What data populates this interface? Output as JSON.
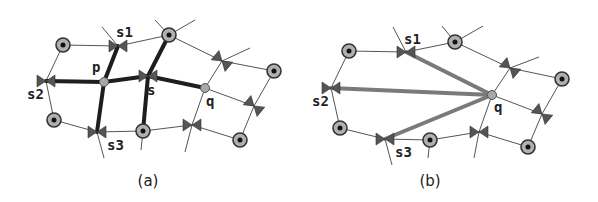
{
  "figure": {
    "colors": {
      "thin_edge": "#555555",
      "thick_edge_a": "#1e1e1e",
      "thick_edge_b": "#7a7a7a",
      "bowtie": "#555555",
      "node_ring": "#333333",
      "node_fill": "#b0b0b0",
      "node_center": "#111111",
      "point_fill": "#a8a8a8"
    },
    "panels": [
      {
        "id": "a",
        "caption": "(a)",
        "caption_pos": [
          148,
          186
        ],
        "circles": [
          [
            63,
            45
          ],
          [
            169,
            35
          ],
          [
            274,
            71
          ],
          [
            54,
            120
          ],
          [
            143,
            131
          ],
          [
            240,
            140
          ]
        ],
        "points": [
          {
            "name": "p",
            "pos": [
              104,
              82
            ],
            "label": "p",
            "label_pos": [
              92,
              72
            ]
          },
          {
            "name": "q",
            "pos": [
              205,
              88
            ],
            "label": "q",
            "label_pos": [
              206,
              106
            ]
          }
        ],
        "bowties": [
          {
            "name": "s1",
            "pos": [
              118,
              46
            ],
            "angle": 0,
            "label": "s1",
            "label_pos": [
              116,
              37
            ]
          },
          {
            "name": "s2",
            "pos": [
              46,
              81
            ],
            "angle": 0,
            "label": "s2",
            "label_pos": [
              27,
              99
            ]
          },
          {
            "name": "s",
            "pos": [
              148,
              76
            ],
            "angle": 0,
            "label": "s",
            "label_pos": [
              147,
              95
            ]
          },
          {
            "name": "s3",
            "pos": [
              97,
              132
            ],
            "angle": 0,
            "label": "s3",
            "label_pos": [
              107,
              150
            ]
          },
          {
            "name": "b1",
            "pos": [
              222,
              61
            ],
            "angle": 40,
            "label": "",
            "label_pos": [
              0,
              0
            ]
          },
          {
            "name": "b2",
            "pos": [
              254,
              106
            ],
            "angle": 40,
            "label": "",
            "label_pos": [
              0,
              0
            ]
          },
          {
            "name": "b3",
            "pos": [
              192,
              125
            ],
            "angle": 0,
            "label": "",
            "label_pos": [
              0,
              0
            ]
          }
        ],
        "thin_edges": [
          [
            [
              63,
              45
            ],
            [
              118,
              46
            ]
          ],
          [
            [
              118,
              46
            ],
            [
              169,
              35
            ]
          ],
          [
            [
              169,
              35
            ],
            [
              222,
              61
            ]
          ],
          [
            [
              222,
              61
            ],
            [
              274,
              71
            ]
          ],
          [
            [
              274,
              71
            ],
            [
              254,
              106
            ]
          ],
          [
            [
              254,
              106
            ],
            [
              240,
              140
            ]
          ],
          [
            [
              240,
              140
            ],
            [
              192,
              125
            ]
          ],
          [
            [
              192,
              125
            ],
            [
              143,
              131
            ]
          ],
          [
            [
              143,
              131
            ],
            [
              97,
              132
            ]
          ],
          [
            [
              97,
              132
            ],
            [
              54,
              120
            ]
          ],
          [
            [
              54,
              120
            ],
            [
              46,
              81
            ]
          ],
          [
            [
              46,
              81
            ],
            [
              63,
              45
            ]
          ],
          [
            [
              205,
              88
            ],
            [
              254,
              106
            ]
          ],
          [
            [
              102,
              27
            ],
            [
              118,
              46
            ]
          ],
          [
            [
              155,
              20
            ],
            [
              169,
              35
            ]
          ],
          [
            [
              169,
              35
            ],
            [
              195,
              20
            ]
          ],
          [
            [
              222,
              61
            ],
            [
              250,
              48
            ]
          ],
          [
            [
              222,
              61
            ],
            [
              205,
              88
            ]
          ],
          [
            [
              205,
              88
            ],
            [
              192,
              125
            ]
          ],
          [
            [
              192,
              125
            ],
            [
              185,
              152
            ]
          ],
          [
            [
              97,
              132
            ],
            [
              104,
              158
            ]
          ],
          [
            [
              143,
              131
            ],
            [
              141,
              150
            ]
          ]
        ],
        "thick_edges": [
          [
            [
              46,
              81
            ],
            [
              104,
              82
            ]
          ],
          [
            [
              104,
              82
            ],
            [
              148,
              76
            ]
          ],
          [
            [
              148,
              76
            ],
            [
              205,
              88
            ]
          ],
          [
            [
              104,
              82
            ],
            [
              118,
              46
            ]
          ],
          [
            [
              104,
              82
            ],
            [
              97,
              132
            ]
          ],
          [
            [
              148,
              76
            ],
            [
              169,
              35
            ]
          ],
          [
            [
              148,
              76
            ],
            [
              143,
              131
            ]
          ]
        ],
        "thick_width": 4
      },
      {
        "id": "b",
        "caption": "(b)",
        "caption_pos": [
          430,
          186
        ],
        "circles": [
          [
            349,
            51
          ],
          [
            455,
            42
          ],
          [
            562,
            79
          ],
          [
            340,
            128
          ],
          [
            430,
            140
          ],
          [
            528,
            147
          ]
        ],
        "points": [
          {
            "name": "q",
            "pos": [
              492,
              95
            ],
            "label": "q",
            "label_pos": [
              494,
              112
            ]
          }
        ],
        "bowties": [
          {
            "name": "s1",
            "pos": [
              406,
              52
            ],
            "angle": 0,
            "label": "s1",
            "label_pos": [
              404,
              44
            ]
          },
          {
            "name": "s2",
            "pos": [
              331,
              88
            ],
            "angle": 0,
            "label": "s2",
            "label_pos": [
              312,
              106
            ]
          },
          {
            "name": "s3",
            "pos": [
              385,
              139
            ],
            "angle": 0,
            "label": "s3",
            "label_pos": [
              395,
              157
            ]
          },
          {
            "name": "b1",
            "pos": [
              510,
              68
            ],
            "angle": 40,
            "label": "",
            "label_pos": [
              0,
              0
            ]
          },
          {
            "name": "b2",
            "pos": [
              542,
              114
            ],
            "angle": 40,
            "label": "",
            "label_pos": [
              0,
              0
            ]
          },
          {
            "name": "b3",
            "pos": [
              479,
              132
            ],
            "angle": 0,
            "label": "",
            "label_pos": [
              0,
              0
            ]
          }
        ],
        "thin_edges": [
          [
            [
              349,
              51
            ],
            [
              406,
              52
            ]
          ],
          [
            [
              406,
              52
            ],
            [
              455,
              42
            ]
          ],
          [
            [
              455,
              42
            ],
            [
              510,
              68
            ]
          ],
          [
            [
              510,
              68
            ],
            [
              562,
              79
            ]
          ],
          [
            [
              562,
              79
            ],
            [
              542,
              114
            ]
          ],
          [
            [
              542,
              114
            ],
            [
              528,
              147
            ]
          ],
          [
            [
              528,
              147
            ],
            [
              479,
              132
            ]
          ],
          [
            [
              479,
              132
            ],
            [
              430,
              140
            ]
          ],
          [
            [
              430,
              140
            ],
            [
              385,
              139
            ]
          ],
          [
            [
              385,
              139
            ],
            [
              340,
              128
            ]
          ],
          [
            [
              340,
              128
            ],
            [
              331,
              88
            ]
          ],
          [
            [
              331,
              88
            ],
            [
              349,
              51
            ]
          ],
          [
            [
              492,
              95
            ],
            [
              542,
              114
            ]
          ],
          [
            [
              393,
              27
            ],
            [
              406,
              52
            ]
          ],
          [
            [
              442,
              26
            ],
            [
              455,
              42
            ]
          ],
          [
            [
              455,
              42
            ],
            [
              483,
              26
            ]
          ],
          [
            [
              510,
              68
            ],
            [
              539,
              57
            ]
          ],
          [
            [
              510,
              68
            ],
            [
              492,
              95
            ]
          ],
          [
            [
              492,
              95
            ],
            [
              479,
              132
            ]
          ],
          [
            [
              479,
              132
            ],
            [
              474,
              158
            ]
          ],
          [
            [
              385,
              139
            ],
            [
              392,
              165
            ]
          ],
          [
            [
              430,
              140
            ],
            [
              428,
              158
            ]
          ]
        ],
        "thick_edges": [
          [
            [
              492,
              95
            ],
            [
              406,
              52
            ]
          ],
          [
            [
              492,
              95
            ],
            [
              331,
              88
            ]
          ],
          [
            [
              492,
              95
            ],
            [
              385,
              139
            ]
          ]
        ],
        "thick_width": 4
      }
    ]
  }
}
